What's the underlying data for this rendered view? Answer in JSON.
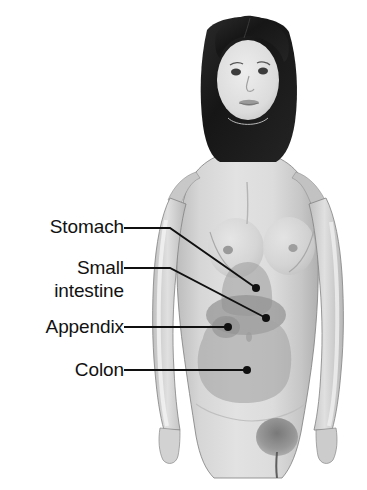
{
  "figure": {
    "background_color": "#ffffff",
    "skin_color": "#d9d9d9",
    "skin_shadow_color": "#b4b4b4",
    "hair_color": "#1e1e1e",
    "outline_color": "#3a3a3a"
  },
  "labels": [
    {
      "id": "stomach",
      "text": "Stomach",
      "line2": "",
      "leader": "elbow",
      "dot_color": "#101010",
      "line_color": "#101010"
    },
    {
      "id": "small-intestine",
      "text": "Small",
      "line2": "intestine",
      "leader": "elbow",
      "dot_color": "#101010",
      "line_color": "#101010"
    },
    {
      "id": "appendix",
      "text": "Appendix",
      "line2": "",
      "leader": "straight",
      "dot_color": "#101010",
      "line_color": "#101010"
    },
    {
      "id": "colon",
      "text": "Colon",
      "line2": "",
      "leader": "straight",
      "dot_color": "#101010",
      "line_color": "#101010"
    }
  ],
  "organs": [
    {
      "id": "stomach",
      "name": "Stomach",
      "fill_color": "#a3a3a3",
      "opacity": 0.62,
      "shape": "rounded dome"
    },
    {
      "id": "small-intestine",
      "name": "Small intestine",
      "fill_color": "#8f8f8f",
      "opacity": 0.68,
      "shape": "horizontal ellipse"
    },
    {
      "id": "colon",
      "name": "Colon",
      "fill_color": "#a3a3a3",
      "opacity": 0.6,
      "shape": "large lower abdominal blob"
    },
    {
      "id": "appendix",
      "name": "Appendix",
      "fill_color": "#8f8f8f",
      "opacity": 0.6,
      "shape": "small lobe at lower right of small intestine"
    }
  ]
}
